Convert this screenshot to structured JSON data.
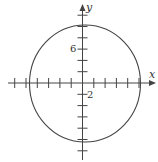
{
  "diagram": {
    "type": "coordinate-plane-circle",
    "axes": {
      "x_label": "x",
      "y_label": "y",
      "tick_step": 2,
      "x_ticks": [
        -12,
        -10,
        -8,
        -6,
        -4,
        -2,
        2,
        4,
        6,
        8,
        10,
        12
      ],
      "y_ticks": [
        -12,
        -10,
        -8,
        -6,
        -4,
        -2,
        2,
        4,
        6,
        8,
        10,
        12
      ],
      "labeled_ticks": [
        {
          "axis": "y",
          "value": 6,
          "text": "6"
        },
        {
          "axis": "x",
          "value": 2,
          "text": "2"
        }
      ]
    },
    "circle": {
      "center": [
        0,
        0
      ],
      "radius": 10
    },
    "colors": {
      "stroke": "#444444",
      "text": "#333333",
      "background": "#ffffff"
    }
  }
}
